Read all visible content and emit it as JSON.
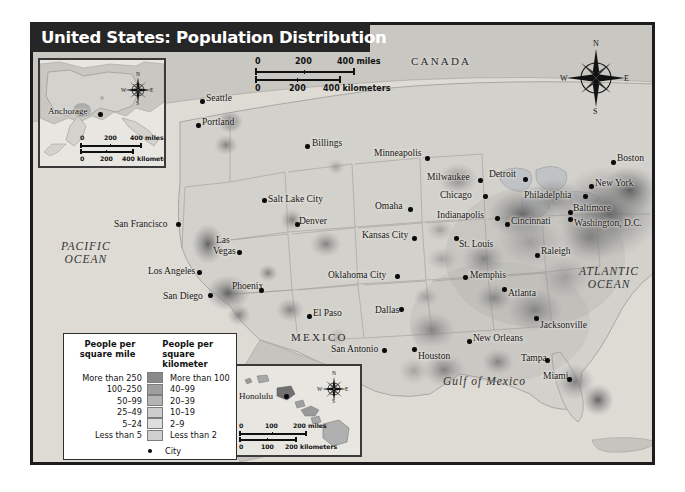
{
  "title": "United States: Population Distribution",
  "regions": [
    {
      "name": "CANADA",
      "x": 408,
      "y": 60
    },
    {
      "name": "MEXICO",
      "x": 288,
      "y": 336
    }
  ],
  "waters": [
    {
      "name": "PACIFIC\nOCEAN",
      "line1": "PACIFIC",
      "line2": "OCEAN",
      "x": 58,
      "y": 247
    },
    {
      "name": "ATLANTIC\nOCEAN",
      "line1": "ATLANTIC",
      "line2": "OCEAN",
      "x": 580,
      "y": 272
    },
    {
      "name": "Gulf of Mexico",
      "line1": "Gulf of Mexico",
      "line2": "",
      "x": 443,
      "y": 380
    }
  ],
  "cities": [
    {
      "label": "Seattle",
      "lx": 206,
      "ly": 93,
      "dx": 200,
      "dy": 99,
      "anchor": "left"
    },
    {
      "label": "Portland",
      "lx": 202,
      "ly": 117,
      "dx": 196,
      "dy": 123,
      "anchor": "left"
    },
    {
      "label": "Billings",
      "lx": 312,
      "ly": 138,
      "dx": 305,
      "dy": 144,
      "anchor": "left"
    },
    {
      "label": "Minneapolis",
      "lx": 374,
      "ly": 148,
      "dx": 425,
      "dy": 156,
      "anchor": "left"
    },
    {
      "label": "Milwaukee",
      "lx": 427,
      "ly": 172,
      "dx": 478,
      "dy": 178,
      "anchor": "left"
    },
    {
      "label": "Detroit",
      "lx": 489,
      "ly": 169,
      "dx": 523,
      "dy": 177,
      "anchor": "left"
    },
    {
      "label": "Chicago",
      "lx": 440,
      "ly": 190,
      "dx": 483,
      "dy": 194,
      "anchor": "left"
    },
    {
      "label": "Boston",
      "lx": 617,
      "ly": 153,
      "dx": 611,
      "dy": 160,
      "anchor": "left"
    },
    {
      "label": "New York",
      "lx": 595,
      "ly": 178,
      "dx": 589,
      "dy": 184,
      "anchor": "left"
    },
    {
      "label": "Philadelphia",
      "lx": 524,
      "ly": 190,
      "dx": 583,
      "dy": 194,
      "anchor": "left"
    },
    {
      "label": "Baltimore",
      "lx": 573,
      "ly": 203,
      "dx": 568,
      "dy": 210,
      "anchor": "left"
    },
    {
      "label": "Washington, D.C.",
      "lx": 574,
      "ly": 218,
      "dx": 568,
      "dy": 217,
      "anchor": "left"
    },
    {
      "label": "Cincinnati",
      "lx": 511,
      "ly": 216,
      "dx": 505,
      "dy": 222,
      "anchor": "left"
    },
    {
      "label": "Indianapolis",
      "lx": 437,
      "ly": 210,
      "dx": 495,
      "dy": 216,
      "anchor": "left"
    },
    {
      "label": "Omaha",
      "lx": 375,
      "ly": 201,
      "dx": 408,
      "dy": 207,
      "anchor": "left"
    },
    {
      "label": "Kansas City",
      "lx": 362,
      "ly": 230,
      "dx": 412,
      "dy": 236,
      "anchor": "left"
    },
    {
      "label": "St. Louis",
      "lx": 459,
      "ly": 239,
      "dx": 454,
      "dy": 236,
      "anchor": "left"
    },
    {
      "label": "Salt Lake City",
      "lx": 268,
      "ly": 194,
      "dx": 262,
      "dy": 198,
      "anchor": "left"
    },
    {
      "label": "Denver",
      "lx": 299,
      "ly": 216,
      "dx": 295,
      "dy": 222,
      "anchor": "left"
    },
    {
      "label": "San Francisco",
      "lx": 114,
      "ly": 219,
      "dx": 176,
      "dy": 222,
      "anchor": "left"
    },
    {
      "label": "Las",
      "lx": 216,
      "ly": 235,
      "dx": 237,
      "dy": 250,
      "anchor": "left"
    },
    {
      "label": "Vegas",
      "lx": 213,
      "ly": 246,
      "dx": -1,
      "dy": -1,
      "anchor": "left"
    },
    {
      "label": "Los Angeles",
      "lx": 148,
      "ly": 266,
      "dx": 197,
      "dy": 270,
      "anchor": "left"
    },
    {
      "label": "San Diego",
      "lx": 163,
      "ly": 291,
      "dx": 208,
      "dy": 293,
      "anchor": "left"
    },
    {
      "label": "Phoenix",
      "lx": 232,
      "ly": 281,
      "dx": 259,
      "dy": 288,
      "anchor": "left"
    },
    {
      "label": "Oklahoma City",
      "lx": 328,
      "ly": 270,
      "dx": 395,
      "dy": 274,
      "anchor": "left"
    },
    {
      "label": "Dallas",
      "lx": 375,
      "ly": 305,
      "dx": 399,
      "dy": 307,
      "anchor": "left"
    },
    {
      "label": "El Paso",
      "lx": 313,
      "ly": 308,
      "dx": 307,
      "dy": 314,
      "anchor": "left"
    },
    {
      "label": "San Antonio",
      "lx": 331,
      "ly": 344,
      "dx": 382,
      "dy": 348,
      "anchor": "left"
    },
    {
      "label": "Houston",
      "lx": 418,
      "ly": 351,
      "dx": 412,
      "dy": 347,
      "anchor": "left"
    },
    {
      "label": "Memphis",
      "lx": 470,
      "ly": 270,
      "dx": 463,
      "dy": 275,
      "anchor": "left"
    },
    {
      "label": "Atlanta",
      "lx": 508,
      "ly": 288,
      "dx": 502,
      "dy": 287,
      "anchor": "left"
    },
    {
      "label": "New Orleans",
      "lx": 473,
      "ly": 333,
      "dx": 467,
      "dy": 339,
      "anchor": "left"
    },
    {
      "label": "Tampa",
      "lx": 521,
      "ly": 353,
      "dx": 545,
      "dy": 358,
      "anchor": "left"
    },
    {
      "label": "Miami",
      "lx": 543,
      "ly": 371,
      "dx": 567,
      "dy": 377,
      "anchor": "left"
    },
    {
      "label": "Jacksonville",
      "lx": 540,
      "ly": 320,
      "dx": 534,
      "dy": 316,
      "anchor": "left"
    },
    {
      "label": "Raleigh",
      "lx": 541,
      "ly": 246,
      "dx": 535,
      "dy": 253,
      "anchor": "left"
    }
  ],
  "main_scale": {
    "miles": {
      "zero": "0",
      "mid": "200",
      "end": "400 miles"
    },
    "km": {
      "zero": "0",
      "mid": "200",
      "end": "400 kilometers"
    }
  },
  "alaska_inset": {
    "city": "Anchorage",
    "scale": {
      "miles": {
        "zero": "0",
        "mid": "200",
        "end": "400 miles"
      },
      "km": {
        "zero": "0",
        "mid": "200",
        "end": "400 kilometers"
      }
    }
  },
  "hawaii_inset": {
    "city": "Honolulu",
    "scale": {
      "miles": {
        "zero": "0",
        "mid": "100",
        "end": "200 miles"
      },
      "km": {
        "zero": "0",
        "mid": "100",
        "end": "200 kilometers"
      }
    }
  },
  "compass": {
    "n": "N",
    "e": "E",
    "s": "S",
    "w": "W"
  },
  "legend": {
    "head_mile": "People per\nsquare mile",
    "head_mile_l1": "People per",
    "head_mile_l2": "square mile",
    "head_km_l1": "People per",
    "head_km_l2": "square kilometer",
    "city_label": "City",
    "rows": [
      {
        "mile": "More than 250",
        "km": "More than 100",
        "color": "#8a8a8a"
      },
      {
        "mile": "100–250",
        "km": "40–99",
        "color": "#9e9e9e"
      },
      {
        "mile": "50–99",
        "km": "20–39",
        "color": "#b4b4b4"
      },
      {
        "mile": "25–49",
        "km": "10–19",
        "color": "#cdcdcd"
      },
      {
        "mile": "5–24",
        "km": "2–9",
        "color": "#dedede"
      },
      {
        "mile": "Less than 5",
        "km": "Less than 2",
        "color": "#cfcfcf"
      }
    ]
  }
}
